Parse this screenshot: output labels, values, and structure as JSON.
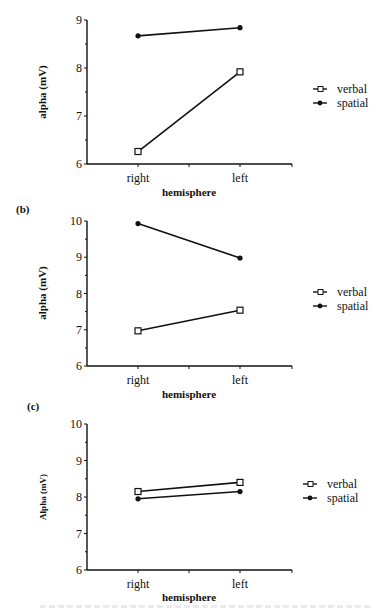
{
  "chart_data": [
    {
      "type": "line",
      "panel_label": "",
      "title": "",
      "xlabel": "hemisphere",
      "ylabel": "alpha (mV)",
      "categories": [
        "right",
        "left"
      ],
      "ylim": [
        6,
        9
      ],
      "yticks": [
        6,
        7,
        8,
        9
      ],
      "grid": false,
      "legend_position": "right",
      "series": [
        {
          "name": "verbal",
          "marker": "open-square",
          "values": [
            6.26,
            7.92
          ]
        },
        {
          "name": "spatial",
          "marker": "filled-circle",
          "values": [
            8.67,
            8.84
          ]
        }
      ]
    },
    {
      "type": "line",
      "panel_label": "(b)",
      "title": "",
      "xlabel": "hemisphere",
      "ylabel": "alpha (mV)",
      "categories": [
        "right",
        "left"
      ],
      "ylim": [
        6,
        10
      ],
      "yticks": [
        6,
        7,
        8,
        9,
        10
      ],
      "grid": false,
      "legend_position": "right",
      "series": [
        {
          "name": "verbal",
          "marker": "open-square",
          "values": [
            6.97,
            7.54
          ]
        },
        {
          "name": "spatial",
          "marker": "filled-circle",
          "values": [
            9.93,
            8.98
          ]
        }
      ]
    },
    {
      "type": "line",
      "panel_label": "(c)",
      "title": "",
      "xlabel": "hemisphere",
      "ylabel": "Alpha (mV)",
      "categories": [
        "right",
        "left"
      ],
      "ylim": [
        6,
        10
      ],
      "yticks": [
        6,
        7,
        8,
        9,
        10
      ],
      "grid": false,
      "legend_position": "right",
      "series": [
        {
          "name": "verbal",
          "marker": "open-square",
          "values": [
            8.15,
            8.4
          ]
        },
        {
          "name": "spatial",
          "marker": "filled-circle",
          "values": [
            7.95,
            8.15
          ]
        }
      ]
    }
  ]
}
